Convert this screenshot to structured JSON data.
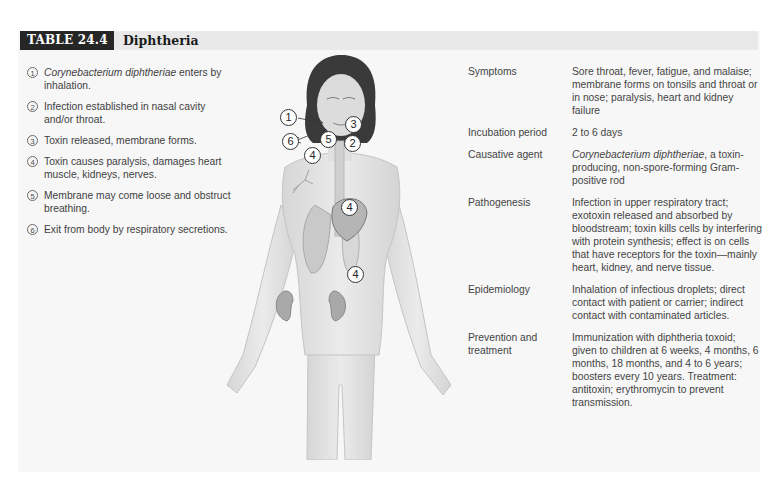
{
  "header": {
    "table_number": "TABLE 24.4",
    "title": "Diphtheria"
  },
  "steps": [
    {
      "num": "1",
      "italic": "Corynebacterium diphtheriae",
      "text": " enters by inhalation."
    },
    {
      "num": "2",
      "italic": "",
      "text": "Infection established in nasal cavity and/or throat."
    },
    {
      "num": "3",
      "italic": "",
      "text": "Toxin released, membrane forms."
    },
    {
      "num": "4",
      "italic": "",
      "text": "Toxin causes paralysis, damages heart muscle, kidneys, nerves."
    },
    {
      "num": "5",
      "italic": "",
      "text": "Membrane may come loose and obstruct breathing."
    },
    {
      "num": "6",
      "italic": "",
      "text": "Exit from body by respiratory secretions."
    }
  ],
  "figure": {
    "callouts": [
      {
        "label": "1",
        "x": 74,
        "y": 54
      },
      {
        "label": "3",
        "x": 130,
        "y": 61
      },
      {
        "label": "6",
        "x": 67,
        "y": 78
      },
      {
        "label": "5",
        "x": 105,
        "y": 76
      },
      {
        "label": "2",
        "x": 129,
        "y": 80
      },
      {
        "label": "4",
        "x": 89,
        "y": 92
      },
      {
        "label": "4",
        "x": 126,
        "y": 144
      },
      {
        "label": "4",
        "x": 132,
        "y": 211
      }
    ]
  },
  "facts": [
    {
      "label": "Symptoms",
      "value_italic": "",
      "value": "Sore throat, fever, fatigue, and malaise; membrane forms on tonsils and throat or in nose; paralysis, heart and kidney failure"
    },
    {
      "label": "Incubation period",
      "value_italic": "",
      "value": "2 to 6 days"
    },
    {
      "label": "Causative agent",
      "value_italic": "Corynebacterium diphtheriae",
      "value": ", a toxin-producing, non-spore-forming Gram-positive rod"
    },
    {
      "label": "Pathogenesis",
      "value_italic": "",
      "value": "Infection in upper respiratory tract; exotoxin released and absorbed by bloodstream; toxin kills cells by interfering with protein synthesis; effect is on cells that have receptors for the toxin—mainly heart, kidney, and nerve tissue."
    },
    {
      "label": "Epidemiology",
      "value_italic": "",
      "value": "Inhalation of infectious droplets; direct contact with patient or carrier; indirect contact with contaminated articles."
    },
    {
      "label": "Prevention and treatment",
      "value_italic": "",
      "value": "Immunization with diphtheria toxoid; given to children at 6 weeks, 4 months, 6 months, 18 months, and 4 to 6 years; boosters every 10 years. Treatment: antitoxin; erythromycin to prevent transmission."
    }
  ]
}
